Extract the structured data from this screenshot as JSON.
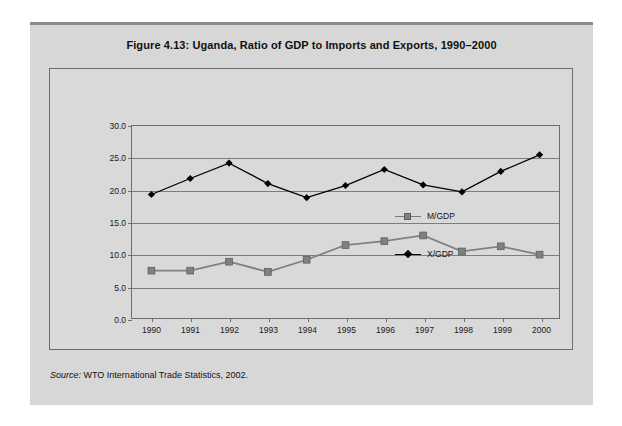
{
  "figure": {
    "caption": "Figure 4.13:  Uganda, Ratio of GDP to Imports and Exports, 1990–2000",
    "source_label": "Source:",
    "source_text": " WTO International Trade Statistics, 2002."
  },
  "legend": {
    "items": [
      {
        "label": "M/GDP",
        "marker": "square-marker-icon",
        "color": "#808080"
      },
      {
        "label": "X/GDP",
        "marker": "diamond-marker-icon",
        "color": "#000000"
      }
    ]
  },
  "colors": {
    "page_background": "#ffffff",
    "figure_background": "#d7d7d7",
    "panel_background": "#d9d9d9",
    "panel_border": "#6d6d6d",
    "gridline": "#7d7d7d",
    "series_mgdp": "#808080",
    "series_xgdp": "#000000",
    "text": "#111111"
  },
  "chart_data": {
    "type": "line",
    "title": "Figure 4.13:  Uganda, Ratio of GDP to Imports and Exports, 1990–2000",
    "xlabel": "",
    "ylabel": "",
    "categories": [
      "1990",
      "1991",
      "1992",
      "1993",
      "1994",
      "1995",
      "1996",
      "1997",
      "1998",
      "1999",
      "2000"
    ],
    "x_tick_labels": [
      "1990",
      "1991",
      "1992",
      "1993",
      "1994",
      "1995",
      "1996",
      "1997",
      "1998",
      "1999",
      "2000"
    ],
    "y_tick_labels": [
      "0.0",
      "5.0",
      "10.0",
      "15.0",
      "20.0",
      "25.0",
      "30.0"
    ],
    "y_ticks": [
      0.0,
      5.0,
      10.0,
      15.0,
      20.0,
      25.0,
      30.0
    ],
    "ylim": [
      0.0,
      30.0
    ],
    "grid": "horizontal",
    "legend_position": "inside-right",
    "series": [
      {
        "name": "M/GDP",
        "marker": "square",
        "color": "#808080",
        "values": [
          7.4,
          7.4,
          8.8,
          7.2,
          9.1,
          11.4,
          12.0,
          12.9,
          10.4,
          11.2,
          9.9
        ]
      },
      {
        "name": "X/GDP",
        "marker": "diamond",
        "color": "#000000",
        "values": [
          19.3,
          21.8,
          24.2,
          21.0,
          18.8,
          20.7,
          23.2,
          20.8,
          19.7,
          22.9,
          25.5
        ]
      }
    ]
  }
}
